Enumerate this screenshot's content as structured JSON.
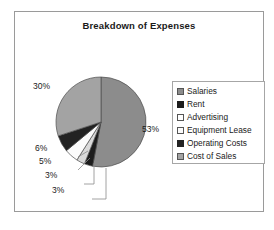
{
  "chart_data": {
    "type": "pie",
    "title": "Breakdown of Expenses",
    "categories": [
      "Salaries",
      "Rent",
      "Advertising",
      "Equipment Lease",
      "Operating Costs",
      "Cost of Sales"
    ],
    "values": [
      53,
      3,
      3,
      5,
      6,
      30
    ],
    "value_labels": [
      "53%",
      "3%",
      "3%",
      "5%",
      "6%",
      "30%"
    ],
    "unit": "%",
    "colors": [
      "#8c8c8c",
      "#1c1c1c",
      "#d9d9d9",
      "#fbfbfb",
      "#222222",
      "#a3a3a3"
    ],
    "slice_border_color": "#4d4d4d",
    "start_angle_deg": 0,
    "direction": "clockwise",
    "legend_position": "right",
    "grid": false,
    "xlabel": "",
    "ylabel": "",
    "labels_outside": true
  },
  "legend": {
    "items": [
      {
        "label": "Salaries",
        "swatch": "#8c8c8c",
        "border": "#555555"
      },
      {
        "label": "Rent",
        "swatch": "#1c1c1c",
        "border": "#1c1c1c"
      },
      {
        "label": "Advertising",
        "swatch": "#ffffff",
        "border": "#555555"
      },
      {
        "label": "Equipment Lease",
        "swatch": "#fbfbfb",
        "border": "#555555"
      },
      {
        "label": "Operating Costs",
        "swatch": "#222222",
        "border": "#222222"
      },
      {
        "label": "Cost of Sales",
        "swatch": "#a3a3a3",
        "border": "#555555"
      }
    ]
  },
  "labels": {
    "salaries_pct": "53%",
    "cost_of_sales_pct": "30%",
    "operating_costs_pct": "6%",
    "equipment_lease_pct": "5%",
    "advertising_pct": "3%",
    "rent_pct": "3%"
  },
  "style": {
    "frame_border": "#9a9a9a",
    "background": "#ffffff",
    "text_color": "#1a1a1a"
  }
}
